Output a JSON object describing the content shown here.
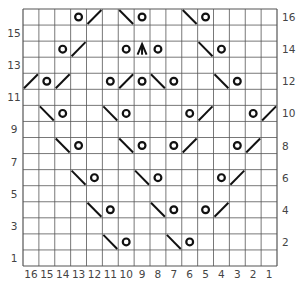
{
  "chart": {
    "type": "knitting-chart",
    "columns": 16,
    "rows": 16,
    "column_labels": [
      "16",
      "15",
      "14",
      "13",
      "12",
      "11",
      "10",
      "9",
      "8",
      "7",
      "6",
      "5",
      "4",
      "3",
      "2",
      "1"
    ],
    "row_labels_left": [
      "15",
      "13",
      "11",
      "9",
      "7",
      "5",
      "3",
      "1"
    ],
    "row_labels_right": [
      "16",
      "14",
      "12",
      "10",
      "8",
      "6",
      "4",
      "2"
    ],
    "colors": {
      "grid": "#555555",
      "symbol": "#111111",
      "background": "#ffffff",
      "label": "#444444"
    },
    "legend": {
      "O": "yarn-over",
      "/": "k2tog (right-slanting decrease)",
      "\\": "ssk (left-slanting decrease)",
      "A": "centered double decrease"
    },
    "symbols": [
      {
        "row": 16,
        "col": 13,
        "s": "O"
      },
      {
        "row": 16,
        "col": 12,
        "s": "/"
      },
      {
        "row": 16,
        "col": 10,
        "s": "\\"
      },
      {
        "row": 16,
        "col": 9,
        "s": "O"
      },
      {
        "row": 16,
        "col": 6,
        "s": "\\"
      },
      {
        "row": 16,
        "col": 5,
        "s": "O"
      },
      {
        "row": 14,
        "col": 14,
        "s": "O"
      },
      {
        "row": 14,
        "col": 13,
        "s": "/"
      },
      {
        "row": 14,
        "col": 10,
        "s": "O"
      },
      {
        "row": 14,
        "col": 9,
        "s": "A"
      },
      {
        "row": 14,
        "col": 8,
        "s": "O"
      },
      {
        "row": 14,
        "col": 5,
        "s": "\\"
      },
      {
        "row": 14,
        "col": 4,
        "s": "O"
      },
      {
        "row": 12,
        "col": 16,
        "s": "/"
      },
      {
        "row": 12,
        "col": 15,
        "s": "O"
      },
      {
        "row": 12,
        "col": 14,
        "s": "/"
      },
      {
        "row": 12,
        "col": 11,
        "s": "O"
      },
      {
        "row": 12,
        "col": 10,
        "s": "/"
      },
      {
        "row": 12,
        "col": 9,
        "s": "O"
      },
      {
        "row": 12,
        "col": 8,
        "s": "\\"
      },
      {
        "row": 12,
        "col": 7,
        "s": "O"
      },
      {
        "row": 12,
        "col": 4,
        "s": "\\"
      },
      {
        "row": 12,
        "col": 3,
        "s": "O"
      },
      {
        "row": 10,
        "col": 15,
        "s": "\\"
      },
      {
        "row": 10,
        "col": 14,
        "s": "O"
      },
      {
        "row": 10,
        "col": 11,
        "s": "\\"
      },
      {
        "row": 10,
        "col": 10,
        "s": "O"
      },
      {
        "row": 10,
        "col": 6,
        "s": "O"
      },
      {
        "row": 10,
        "col": 5,
        "s": "/"
      },
      {
        "row": 10,
        "col": 2,
        "s": "O"
      },
      {
        "row": 10,
        "col": 1,
        "s": "/"
      },
      {
        "row": 8,
        "col": 14,
        "s": "\\"
      },
      {
        "row": 8,
        "col": 13,
        "s": "O"
      },
      {
        "row": 8,
        "col": 10,
        "s": "\\"
      },
      {
        "row": 8,
        "col": 9,
        "s": "O"
      },
      {
        "row": 8,
        "col": 7,
        "s": "O"
      },
      {
        "row": 8,
        "col": 6,
        "s": "/"
      },
      {
        "row": 8,
        "col": 3,
        "s": "O"
      },
      {
        "row": 8,
        "col": 2,
        "s": "/"
      },
      {
        "row": 6,
        "col": 13,
        "s": "\\"
      },
      {
        "row": 6,
        "col": 12,
        "s": "O"
      },
      {
        "row": 6,
        "col": 9,
        "s": "\\"
      },
      {
        "row": 6,
        "col": 8,
        "s": "O"
      },
      {
        "row": 6,
        "col": 4,
        "s": "O"
      },
      {
        "row": 6,
        "col": 3,
        "s": "/"
      },
      {
        "row": 4,
        "col": 12,
        "s": "\\"
      },
      {
        "row": 4,
        "col": 11,
        "s": "O"
      },
      {
        "row": 4,
        "col": 8,
        "s": "\\"
      },
      {
        "row": 4,
        "col": 7,
        "s": "O"
      },
      {
        "row": 4,
        "col": 5,
        "s": "O"
      },
      {
        "row": 4,
        "col": 4,
        "s": "/"
      },
      {
        "row": 2,
        "col": 11,
        "s": "\\"
      },
      {
        "row": 2,
        "col": 10,
        "s": "O"
      },
      {
        "row": 2,
        "col": 7,
        "s": "\\"
      },
      {
        "row": 2,
        "col": 6,
        "s": "O"
      }
    ]
  }
}
